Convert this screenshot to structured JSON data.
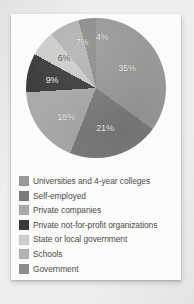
{
  "chart_data": {
    "type": "pie",
    "title": "",
    "subtitle": "",
    "xlabel": "",
    "ylabel": "",
    "legend_position": "bottom",
    "grid": false,
    "categories": [
      "Universities and 4-year colleges",
      "Self-employed",
      "Private companies",
      "Private not-for-profit organizations",
      "State or local government",
      "Schools",
      "Government"
    ],
    "values": [
      35,
      21,
      18,
      9,
      6,
      7,
      4
    ],
    "value_labels": [
      "35%",
      "21%",
      "18%",
      "9%",
      "6%",
      "7%",
      "4%"
    ],
    "units": "percent",
    "colors": [
      "#9a9a98",
      "#7c7c7a",
      "#a9a9a7",
      "#3a3a38",
      "#cccccb",
      "#b3b3b1",
      "#8d8d8b"
    ],
    "slices": [
      {
        "label": "Universities and 4-year colleges",
        "value": 35,
        "value_label": "35%",
        "color": "#9a9a98",
        "label_x": 101,
        "label_y": 50,
        "label_light": true
      },
      {
        "label": "Self-employed",
        "value": 21,
        "value_label": "21%",
        "color": "#7c7c7a",
        "label_x": 79,
        "label_y": 110,
        "label_light": true
      },
      {
        "label": "Private companies",
        "value": 18,
        "value_label": "18%",
        "color": "#a9a9a7",
        "label_x": 40,
        "label_y": 99,
        "label_light": true
      },
      {
        "label": "Private not-for-profit organizations",
        "value": 9,
        "value_label": "9%",
        "color": "#3a3a38",
        "label_x": 26,
        "label_y": 62,
        "label_light": true
      },
      {
        "label": "State or local government",
        "value": 6,
        "value_label": "6%",
        "color": "#cccccb",
        "label_x": 38,
        "label_y": 40,
        "label_light": false
      },
      {
        "label": "Schools",
        "value": 7,
        "value_label": "7%",
        "color": "#b3b3b1",
        "label_x": 56,
        "label_y": 24,
        "label_light": true
      },
      {
        "label": "Government",
        "value": 4,
        "value_label": "4%",
        "color": "#8d8d8b",
        "label_x": 76,
        "label_y": 19,
        "label_light": true
      }
    ]
  },
  "legend": {
    "items": [
      {
        "label": "Universities and 4-year colleges",
        "color": "#9a9a98"
      },
      {
        "label": "Self-employed",
        "color": "#7c7c7a"
      },
      {
        "label": "Private companies",
        "color": "#a9a9a7"
      },
      {
        "label": "Private not-for-profit organizations",
        "color": "#3a3a38"
      },
      {
        "label": "State or local government",
        "color": "#cccccb"
      },
      {
        "label": "Schools",
        "color": "#b3b3b1"
      },
      {
        "label": "Government",
        "color": "#8d8d8b"
      }
    ]
  }
}
